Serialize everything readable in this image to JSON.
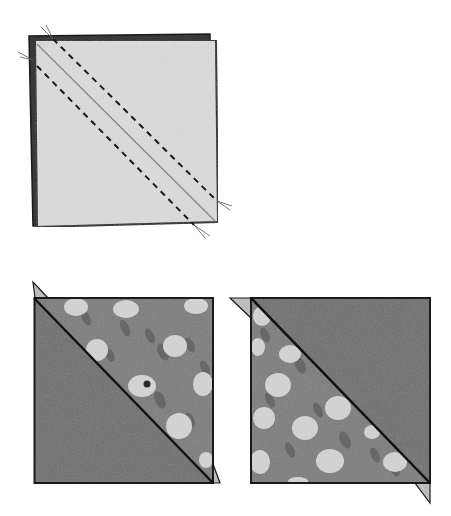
{
  "figure": {
    "steps": [
      {
        "id": "stitched-pair",
        "label": "Two squares layered right sides together, diagonal drawn, stitched 1/4 inch on both sides"
      },
      {
        "id": "hst-units",
        "label": "Cut on the diagonal line to yield two half-square triangle units"
      }
    ]
  },
  "colors": {
    "background": "#ffffff",
    "outline": "#1a1a1a",
    "light_fabric": "#d9d9d9",
    "dark_fabric": "#6e6e6e",
    "print_fabric": "#7c7c7c",
    "print_blossom": "#cfcfcf",
    "print_leaf": "#5f5f5f",
    "dog_ear": "#bdbdbd",
    "thread": "#7a7a7a"
  }
}
